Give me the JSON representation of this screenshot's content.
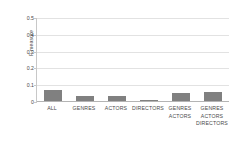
{
  "chart_data": {
    "type": "bar",
    "title": "",
    "subtitle": "",
    "xlabel": "",
    "ylabel": "F-measure",
    "categories": [
      "ALL",
      "GENRES",
      "ACTORS",
      "DIRECTORS",
      "GENRES ACTORS",
      "GENRES ACTORS DIRECTORS"
    ],
    "category_lines": [
      [
        "ALL"
      ],
      [
        "GENRES"
      ],
      [
        "ACTORS"
      ],
      [
        "DIRECTORS"
      ],
      [
        "GENRES",
        "ACTORS"
      ],
      [
        "GENRES",
        "ACTORS",
        "DIRECTORS"
      ]
    ],
    "values": [
      0.072,
      0.037,
      0.038,
      0.013,
      0.055,
      0.057
    ],
    "ylim": [
      0,
      0.5
    ],
    "ytick_values": [
      0.5,
      0.4,
      0.3,
      0.2,
      0.1,
      0
    ],
    "ytick_labels": [
      "0.5",
      "0.4",
      "0.3",
      "0.2",
      "0.1",
      "0"
    ],
    "grid": true,
    "grid_axis": "y",
    "legend": false,
    "legend_position": "none",
    "bar_color": "#808080",
    "gridline_color": "#e2e2e2",
    "axis_color": "#b4b4b4",
    "text_color": "#4a4a4a",
    "background_color": "#ffffff"
  }
}
